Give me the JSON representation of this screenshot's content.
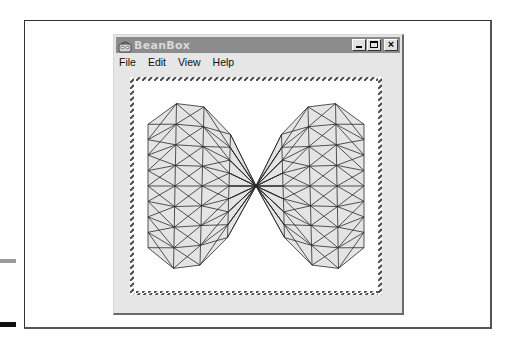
{
  "window": {
    "title": "BeanBox",
    "controls": {
      "minimize": "_",
      "maximize": "□",
      "close": "×"
    },
    "icon": "beanbox-app-icon"
  },
  "menubar": {
    "items": [
      {
        "label": "File"
      },
      {
        "label": "Edit"
      },
      {
        "label": "View"
      },
      {
        "label": "Help"
      }
    ]
  },
  "canvas": {
    "content": "wireframe-saddle-surface",
    "selection_border": "hatched",
    "mesh": {
      "grid_n": 8,
      "stroke": "#2a2a2a",
      "fill": "#e4e4e4"
    }
  },
  "colors": {
    "titlebar_inactive": "#8c8c8c",
    "title_text": "#d9d9d9",
    "window_bg": "#e6e6e6",
    "canvas_bg": "#ffffff"
  }
}
